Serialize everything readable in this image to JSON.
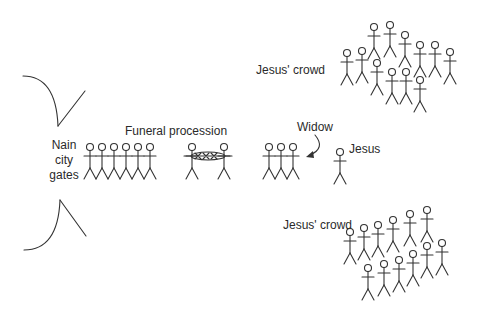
{
  "labels": {
    "gates_line1": "Nain",
    "gates_line2": "city",
    "gates_line3": "gates",
    "funeral": "Funeral procession",
    "widow": "Widow",
    "jesus": "Jesus",
    "crowd_top": "Jesus' crowd",
    "crowd_bottom": "Jesus' crowd"
  },
  "colors": {
    "stroke": "#333333",
    "text": "#2a2a2a",
    "background": "#ffffff"
  },
  "groups": {
    "mourners": [
      [
        90,
        147
      ],
      [
        102,
        147
      ],
      [
        114,
        147
      ],
      [
        126,
        147
      ],
      [
        138,
        147
      ],
      [
        150,
        147
      ]
    ],
    "bearers": [
      [
        192,
        147
      ],
      [
        224,
        147
      ]
    ],
    "widow_group": [
      [
        269,
        147
      ],
      [
        281,
        147
      ],
      [
        293,
        147
      ]
    ],
    "jesus": [
      [
        340,
        152
      ]
    ],
    "crowd_top": [
      [
        374,
        27
      ],
      [
        390,
        25
      ],
      [
        405,
        35
      ],
      [
        420,
        45
      ],
      [
        435,
        45
      ],
      [
        450,
        52
      ],
      [
        347,
        53
      ],
      [
        362,
        51
      ],
      [
        377,
        63
      ],
      [
        392,
        72
      ],
      [
        406,
        72
      ],
      [
        420,
        80
      ]
    ],
    "crowd_bottom": [
      [
        410,
        214
      ],
      [
        427,
        210
      ],
      [
        393,
        220
      ],
      [
        378,
        225
      ],
      [
        364,
        228
      ],
      [
        350,
        232
      ],
      [
        368,
        268
      ],
      [
        384,
        264
      ],
      [
        399,
        260
      ],
      [
        413,
        254
      ],
      [
        427,
        246
      ],
      [
        442,
        243
      ]
    ]
  }
}
